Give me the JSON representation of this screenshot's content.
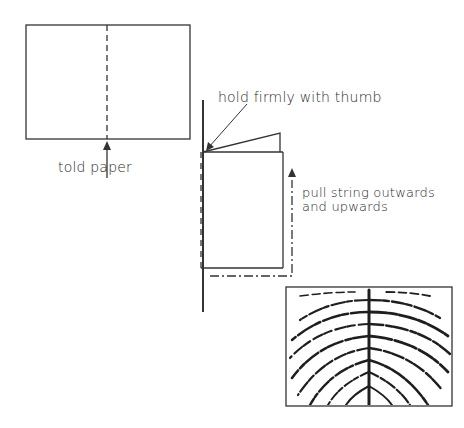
{
  "diagram": {
    "step1": {
      "caption": "told paper",
      "elements": [
        "sheet-rectangle",
        "dashed-fold-line",
        "arrow-up"
      ]
    },
    "step2": {
      "label_hold": "hold firmly with thumb",
      "label_pull_line1": "pull string outwards",
      "label_pull_line2": "and upwards",
      "elements": [
        "vertical-stick",
        "folded-paper",
        "paper-flap",
        "dash-dot-string-path",
        "arrow-up"
      ]
    },
    "result_image": {
      "description": "textured fern/feather-like print with central vein and curved branches",
      "elements": [
        "framed-print"
      ]
    },
    "colors": {
      "line": "#333333",
      "background": "#ffffff",
      "texture": "#1e1e1e"
    }
  }
}
